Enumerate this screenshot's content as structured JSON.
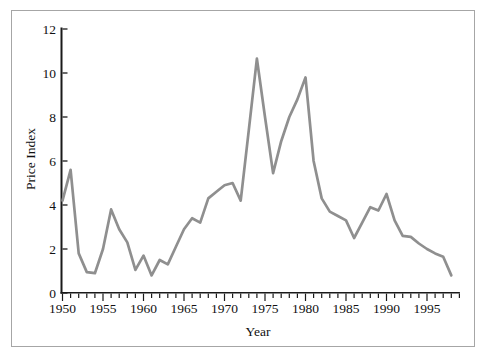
{
  "chart_data": {
    "type": "line",
    "title": "",
    "xlabel": "Year",
    "ylabel": "Price Index",
    "x": [
      1950,
      1951,
      1952,
      1953,
      1954,
      1955,
      1956,
      1957,
      1958,
      1959,
      1960,
      1961,
      1962,
      1963,
      1964,
      1965,
      1966,
      1967,
      1968,
      1969,
      1970,
      1971,
      1972,
      1973,
      1974,
      1975,
      1976,
      1977,
      1978,
      1979,
      1980,
      1981,
      1982,
      1983,
      1984,
      1985,
      1986,
      1987,
      1988,
      1989,
      1990,
      1991,
      1992,
      1993,
      1994,
      1995,
      1996,
      1997,
      1998
    ],
    "values": [
      4.2,
      5.6,
      1.8,
      0.95,
      0.9,
      2.0,
      3.8,
      2.9,
      2.3,
      1.05,
      1.7,
      0.8,
      1.5,
      1.3,
      2.1,
      2.9,
      3.4,
      3.2,
      4.3,
      4.6,
      4.9,
      5.0,
      4.2,
      7.4,
      10.65,
      8.0,
      5.45,
      6.9,
      8.0,
      8.8,
      9.8,
      6.0,
      4.3,
      3.7,
      3.5,
      3.3,
      2.5,
      3.2,
      3.9,
      3.75,
      4.5,
      3.3,
      2.6,
      2.55,
      2.25,
      2.0,
      1.8,
      1.65,
      0.8
    ],
    "ylim": [
      0,
      12
    ],
    "xlim": [
      1950,
      1999
    ],
    "yticks": [
      0,
      2,
      4,
      6,
      8,
      10,
      12
    ],
    "ytick_labels": [
      "0",
      "2",
      "4",
      "6",
      "8",
      "10",
      "12"
    ],
    "xtick_labels": [
      1950,
      1955,
      1960,
      1965,
      1970,
      1975,
      1980,
      1985,
      1990,
      1995
    ],
    "xtick_minor_start": 1950,
    "xtick_minor_end": 1999,
    "xtick_minor_step": 1,
    "xtick_major_step": 5,
    "grid": false,
    "legend": "none",
    "line_color": "#8f8f8f",
    "axis_color": "#1a1a1a",
    "label_color": "#111111",
    "frame_color": "#a6a6a6"
  }
}
